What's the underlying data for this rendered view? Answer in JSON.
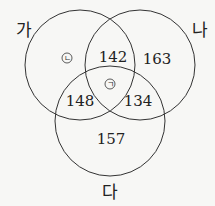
{
  "sets": [
    {
      "label": "가",
      "cx": 80,
      "cy": 65,
      "r": 55
    },
    {
      "label": "나",
      "cx": 140,
      "cy": 65,
      "r": 55
    },
    {
      "label": "다",
      "cx": 110,
      "cy": 121,
      "r": 55
    }
  ],
  "regions": {
    "ga_only": "ㄴ",
    "ga_na": "142",
    "na_only": "163",
    "ga_na_da": "ㄱ",
    "ga_da": "148",
    "na_da": "134",
    "da_only": "157"
  },
  "colors": {
    "line": "#333333",
    "background": "#f7f7f5"
  }
}
